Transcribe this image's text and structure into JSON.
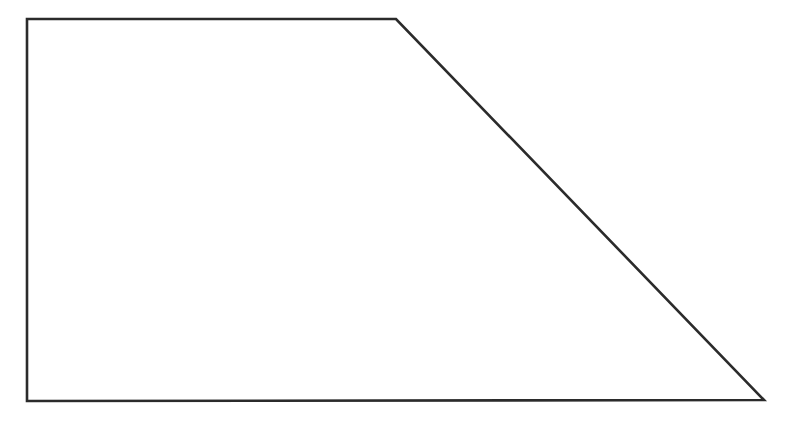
{
  "canvas": {
    "width": 789,
    "height": 440,
    "background_color": "#ffffff",
    "title": "Quadrilateral Figure"
  },
  "figure": {
    "name": "right-trapezoid",
    "shape_type": "quadrilateral",
    "stroke_color": "#2b2b2b",
    "fill_color": "#ffffff",
    "stroke_width": 2.6,
    "vertices": [
      {
        "label": "top-left",
        "x": 27,
        "y": 19
      },
      {
        "label": "top-right",
        "x": 396,
        "y": 19
      },
      {
        "label": "bottom-right",
        "x": 764,
        "y": 400
      },
      {
        "label": "bottom-left",
        "x": 27,
        "y": 401
      }
    ],
    "points_attr": "27,19 396,19 764,400 27,401",
    "edges": [
      {
        "name": "top-edge",
        "from": "top-left",
        "to": "top-right",
        "orientation": "horizontal",
        "length_px": 369
      },
      {
        "name": "right-slant-edge",
        "from": "top-right",
        "to": "bottom-right",
        "orientation": "diagonal",
        "length_px": 530
      },
      {
        "name": "bottom-edge",
        "from": "bottom-right",
        "to": "bottom-left",
        "orientation": "horizontal",
        "length_px": 737
      },
      {
        "name": "left-edge",
        "from": "bottom-left",
        "to": "top-left",
        "orientation": "vertical",
        "length_px": 382
      }
    ]
  },
  "chart_data": {
    "type": "scatter",
    "title": "",
    "xlabel": "",
    "ylabel": "",
    "grid": false,
    "legend_position": "none",
    "xlim": [
      0,
      789
    ],
    "ylim": [
      0,
      440
    ],
    "series": [
      {
        "name": "right-trapezoid-outline",
        "closed": true,
        "x": [
          27,
          396,
          764,
          27,
          27
        ],
        "y": [
          19,
          19,
          400,
          401,
          19
        ]
      }
    ],
    "annotations": []
  }
}
